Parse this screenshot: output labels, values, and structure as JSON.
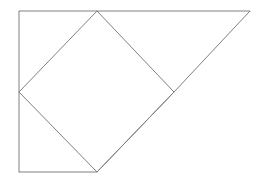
{
  "figure": {
    "canvas": {
      "width": 273,
      "height": 183,
      "background_color": "#ffffff"
    },
    "style": {
      "stroke_color": "#808080",
      "stroke_width": 1,
      "fill": "none"
    },
    "points": {
      "top_left": {
        "x": 19,
        "y": 11
      },
      "top_right": {
        "x": 250,
        "y": 11
      },
      "diamond_top": {
        "x": 97,
        "y": 11
      },
      "diamond_left": {
        "x": 19,
        "y": 92
      },
      "diamond_right": {
        "x": 174,
        "y": 92
      },
      "diamond_bottom": {
        "x": 97,
        "y": 172
      },
      "bottom_left": {
        "x": 19,
        "y": 172
      }
    },
    "shapes": [
      {
        "name": "outline-polygon",
        "type": "polygon",
        "closed": true,
        "points": "19,11 250,11 174,92 97,172 19,172",
        "stroke_color": "#808080",
        "stroke_width": 1
      },
      {
        "name": "rotated-square",
        "type": "polygon",
        "closed": true,
        "points": "97,11 174,92 97,172 19,92",
        "stroke_color": "#808080",
        "stroke_width": 1
      }
    ],
    "segments": [
      {
        "name": "top-horizontal-edge",
        "from": "top_left",
        "to": "top_right",
        "x1": 19,
        "y1": 11,
        "x2": 250,
        "y2": 11
      },
      {
        "name": "left-vertical-edge",
        "from": "top_left",
        "to": "bottom_left",
        "x1": 19,
        "y1": 11,
        "x2": 19,
        "y2": 172
      },
      {
        "name": "bottom-horizontal-edge",
        "from": "bottom_left",
        "to": "diamond_bottom",
        "x1": 19,
        "y1": 172,
        "x2": 97,
        "y2": 172
      },
      {
        "name": "triangle-hypotenuse",
        "from": "top_right",
        "to": "diamond_right",
        "x1": 250,
        "y1": 11,
        "x2": 174,
        "y2": 92
      },
      {
        "name": "lower-right-diagonal",
        "from": "diamond_right",
        "to": "diamond_bottom",
        "x1": 174,
        "y1": 92,
        "x2": 97,
        "y2": 172
      },
      {
        "name": "square-upper-left-edge",
        "from": "diamond_left",
        "to": "diamond_top",
        "x1": 19,
        "y1": 92,
        "x2": 97,
        "y2": 11
      },
      {
        "name": "square-upper-right-edge",
        "from": "diamond_top",
        "to": "diamond_right",
        "x1": 97,
        "y1": 11,
        "x2": 174,
        "y2": 92
      },
      {
        "name": "square-lower-left-edge",
        "from": "diamond_left",
        "to": "diamond_bottom",
        "x1": 19,
        "y1": 92,
        "x2": 97,
        "y2": 172
      }
    ],
    "labels": []
  }
}
